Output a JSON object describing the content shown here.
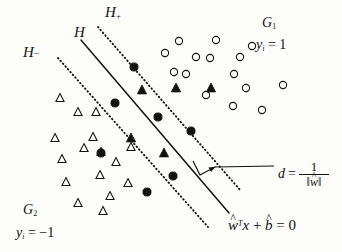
{
  "figure": {
    "name": "svm-maximum-margin-hyperplane",
    "labels": {
      "hyperplane": "H",
      "margin_upper": "H",
      "margin_upper_sign": "+",
      "margin_lower": "H",
      "margin_lower_sign": "−",
      "group_positive": "G",
      "group_positive_sub": "1",
      "group_negative": "G",
      "group_negative_sub": "2",
      "label_positive_var": "y",
      "label_positive_sub": "i",
      "label_positive_value": "= 1",
      "label_negative_var": "y",
      "label_negative_sub": "i",
      "label_negative_value": "= −1",
      "distance_symbol": "d",
      "distance_equals": "=",
      "distance_numerator": "1",
      "distance_denominator_open": "‖",
      "distance_denominator_w": "w",
      "distance_denominator_close": "‖",
      "hyperplane_eq_w": "w",
      "hyperplane_eq_T": "T",
      "hyperplane_eq_x": "x",
      "hyperplane_eq_plus": "+",
      "hyperplane_eq_b": "b",
      "hyperplane_eq_rhs": "= 0"
    },
    "colors": {
      "ink": "#111111",
      "background": "#fdfdfc",
      "marker_fill": "#111111",
      "marker_stroke": "#111111"
    }
  },
  "chart_data": {
    "type": "scatter",
    "title": "",
    "xlabel": "",
    "ylabel": "",
    "xlim": [
      0,
      342
    ],
    "ylim": [
      0,
      252
    ],
    "grid": false,
    "legend": "none",
    "annotations": [
      {
        "text": "H",
        "x": 74,
        "y": 25
      },
      {
        "text": "H+",
        "x": 105,
        "y": 5
      },
      {
        "text": "H−",
        "x": 23,
        "y": 45
      },
      {
        "text": "G1",
        "x": 262,
        "y": 16
      },
      {
        "text": "yi = 1",
        "x": 256,
        "y": 38
      },
      {
        "text": "G2",
        "x": 23,
        "y": 203
      },
      {
        "text": "yi = -1",
        "x": 16,
        "y": 226
      },
      {
        "text": "d = 1/||w||",
        "x": 278,
        "y": 160
      },
      {
        "text": "w^T x + b = 0",
        "x": 228,
        "y": 218
      }
    ],
    "lines": [
      {
        "name": "H",
        "style": "solid",
        "x1": 81,
        "y1": 40,
        "x2": 229,
        "y2": 213
      },
      {
        "name": "H+",
        "style": "dotted",
        "x1": 98,
        "y1": 27,
        "x2": 241,
        "y2": 191
      },
      {
        "name": "H-",
        "style": "dotted",
        "x1": 58,
        "y1": 58,
        "x2": 208,
        "y2": 227
      }
    ],
    "margin_indicator": {
      "bracket_from": [
        193,
        161
      ],
      "bracket_corner": [
        200,
        175
      ],
      "bracket_to": [
        215,
        167
      ],
      "leader_from": [
        215,
        167
      ],
      "leader_to": [
        274,
        166
      ]
    },
    "series": [
      {
        "name": "G1 open circles",
        "marker": "open-circle",
        "points": [
          [
            179,
            41
          ],
          [
            165,
            53
          ],
          [
            196,
            57
          ],
          [
            174,
            72
          ],
          [
            210,
            58
          ],
          [
            216,
            40
          ],
          [
            240,
            57
          ],
          [
            252,
            46
          ],
          [
            234,
            74
          ],
          [
            283,
            85
          ],
          [
            233,
            106
          ],
          [
            262,
            110
          ],
          [
            186,
            74
          ],
          [
            246,
            88
          ],
          [
            206,
            95
          ]
        ]
      },
      {
        "name": "G2 open triangles",
        "marker": "open-triangle",
        "points": [
          [
            60,
            98
          ],
          [
            78,
            112
          ],
          [
            96,
            112
          ],
          [
            55,
            138
          ],
          [
            93,
            137
          ],
          [
            62,
            159
          ],
          [
            101,
            152
          ],
          [
            100,
            175
          ],
          [
            66,
            182
          ],
          [
            128,
            183
          ],
          [
            110,
            196
          ],
          [
            78,
            203
          ],
          [
            103,
            211
          ],
          [
            116,
            162
          ],
          [
            131,
            147
          ],
          [
            84,
            148
          ]
        ]
      },
      {
        "name": "support vectors (filled circles on H-)",
        "marker": "filled-circle",
        "points": [
          [
            134,
            67
          ],
          [
            115,
            103
          ],
          [
            158,
            117
          ],
          [
            191,
            131
          ],
          [
            173,
            176
          ],
          [
            147,
            192
          ],
          [
            101,
            153
          ]
        ]
      },
      {
        "name": "support vectors (filled triangles on H+)",
        "marker": "filled-triangle",
        "points": [
          [
            142,
            90
          ],
          [
            176,
            88
          ],
          [
            211,
            88
          ],
          [
            131,
            138
          ],
          [
            164,
            153
          ]
        ]
      }
    ]
  }
}
